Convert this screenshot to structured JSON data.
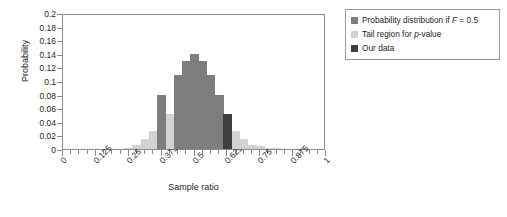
{
  "chart_data": {
    "type": "bar",
    "title": "",
    "xlabel": "Sample ratio",
    "ylabel": "Probability",
    "xlim": [
      0,
      1
    ],
    "ylim": [
      0,
      0.2
    ],
    "grid": false,
    "legend_position": "right-outside",
    "x_tick_labels": [
      "0",
      "0.125",
      "0.25",
      "0.375",
      "0.5",
      "0.625",
      "0.75",
      "0.875",
      "1"
    ],
    "x_tick_values": [
      0,
      0.125,
      0.25,
      0.375,
      0.5,
      0.625,
      0.75,
      0.875,
      1
    ],
    "x_minor_tick_step": 0.03125,
    "y_tick_labels": [
      "0.2",
      "0.18",
      "0.16",
      "0.14",
      "0.12",
      "0.1",
      "0.08",
      "0.06",
      "0.04",
      "0.02",
      "0"
    ],
    "y_tick_values": [
      0.2,
      0.18,
      0.16,
      0.14,
      0.12,
      0.1,
      0.08,
      0.06,
      0.04,
      0.02,
      0
    ],
    "bar_width_ratio": 0.55,
    "series": [
      {
        "name": "Probability distribution if F = 0.5",
        "color": "#7d7d7d",
        "x": [
          0.375,
          0.4375,
          0.46875,
          0.5,
          0.53125,
          0.5625,
          0.59375
        ],
        "values": [
          0.08,
          0.109,
          0.13,
          0.139,
          0.13,
          0.109,
          0.08
        ]
      },
      {
        "name": "Tail region for p-value",
        "color": "#d2d2d2",
        "x": [
          0.25,
          0.28125,
          0.3125,
          0.34375,
          0.40625,
          0.625,
          0.65625,
          0.6875,
          0.71875,
          0.75,
          0.78125,
          0.8125
        ],
        "values": [
          0.002,
          0.006,
          0.014,
          0.027,
          0.051,
          0.051,
          0.027,
          0.014,
          0.006,
          0.004,
          0.002,
          0.001
        ]
      },
      {
        "name": "Our data",
        "color": "#3f3f3f",
        "x": [
          0.625
        ],
        "values": [
          0.051
        ]
      }
    ]
  },
  "axes": {
    "y_title": "Probability",
    "x_title": "Sample ratio"
  },
  "legend": {
    "items": [
      {
        "label_prefix": "Probability distribution if ",
        "label_italic": "F",
        "label_suffix": " = 0.5",
        "swatch": "#7d7d7d"
      },
      {
        "label_prefix": "Tail region for ",
        "label_italic": "p",
        "label_suffix": "-value",
        "swatch": "#d2d2d2"
      },
      {
        "label_prefix": "Our data",
        "label_italic": "",
        "label_suffix": "",
        "swatch": "#3f3f3f"
      }
    ]
  }
}
